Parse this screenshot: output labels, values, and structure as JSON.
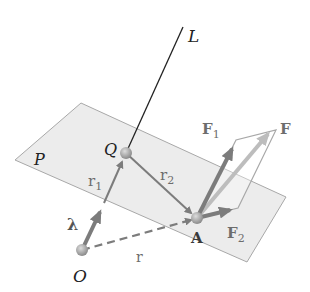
{
  "diagram": {
    "colors": {
      "plane_fill": "#e6e6e6",
      "plane_stroke": "#a8a8a8",
      "vector": "#7c7c7c",
      "vector_light": "#bdbdbd",
      "line_L": "#222222",
      "point": "#9a9a9a",
      "label_dark": "#222222",
      "label_gray": "#6d6d6d"
    },
    "labels": {
      "axis": "L",
      "plane": "P",
      "point_Q": "Q",
      "point_A": "A",
      "origin": "O",
      "unit_vector": "λ",
      "r1_main": "r",
      "r1_sub": "1",
      "r2_main": "r",
      "r2_sub": "2",
      "r": "r",
      "F": "F",
      "F1_main": "F",
      "F1_sub": "1",
      "F2_main": "F",
      "F2_sub": "2"
    },
    "points": {
      "L_top": [
        183,
        27
      ],
      "Q": [
        126,
        153
      ],
      "A": [
        197,
        218
      ],
      "O": [
        82,
        250
      ],
      "lambda_tip": [
        104,
        203
      ],
      "F_tip": [
        276,
        130
      ],
      "F1_tip": [
        236,
        140
      ],
      "F2_tip": [
        238,
        208
      ]
    },
    "plane_corners": [
      [
        81,
        103
      ],
      [
        286,
        197
      ],
      [
        247,
        262
      ],
      [
        15,
        160
      ]
    ]
  }
}
